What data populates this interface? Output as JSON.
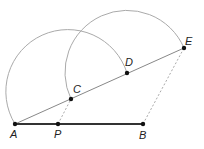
{
  "diagram": {
    "points": {
      "A": {
        "label": "A",
        "x": 15,
        "y": 124
      },
      "P": {
        "label": "P",
        "x": 58,
        "y": 124
      },
      "B": {
        "label": "B",
        "x": 143,
        "y": 124
      },
      "C": {
        "label": "C",
        "x": 71,
        "y": 99
      },
      "D": {
        "label": "D",
        "x": 127,
        "y": 73
      },
      "E": {
        "label": "E",
        "x": 184,
        "y": 48
      }
    },
    "segments": [
      {
        "from": "A",
        "to": "B",
        "style": "solid-thick"
      },
      {
        "from": "A",
        "to": "E",
        "style": "solid"
      },
      {
        "from": "P",
        "to": "C",
        "style": "dashed"
      },
      {
        "from": "B",
        "to": "E",
        "style": "dashed"
      }
    ],
    "arcs": [
      {
        "center": "C",
        "from": "A",
        "to": "D"
      },
      {
        "center": "D",
        "from": "C",
        "to": "E"
      }
    ],
    "colors": {
      "thick_line": "#333333",
      "line": "#888888",
      "arc": "#aaaaaa",
      "dashed": "#aaaaaa",
      "point": "#111111"
    }
  }
}
